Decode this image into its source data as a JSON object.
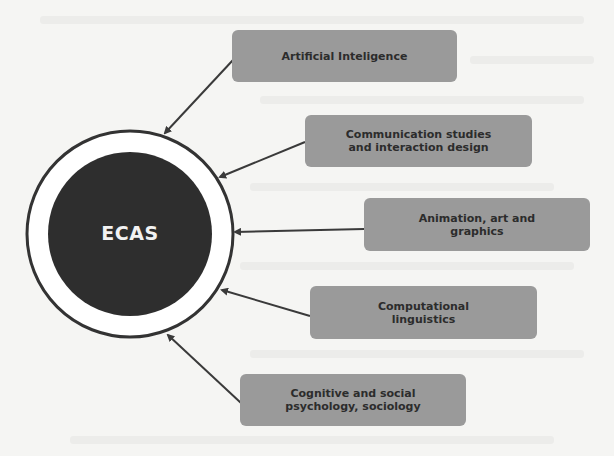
{
  "diagram": {
    "center": {
      "label": "ECAS",
      "fill": "#2e2e2e",
      "ring_color": "#333333"
    },
    "node_fill": "#9a9a9a",
    "arrow_color": "#3a3a3a",
    "nodes": [
      {
        "id": "ai",
        "label": "Artificial Inteligence"
      },
      {
        "id": "comm",
        "label": "Communication studies\nand interaction design"
      },
      {
        "id": "anim",
        "label": "Animation, art and\ngraphics"
      },
      {
        "id": "compling",
        "label": "Computational\nlinguistics"
      },
      {
        "id": "cogsoc",
        "label": "Cognitive and social\npsychology, sociology"
      }
    ]
  }
}
